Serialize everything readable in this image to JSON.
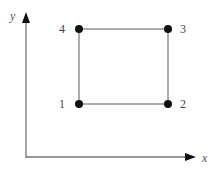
{
  "diagram": {
    "axes": {
      "x_label": "x",
      "y_label": "y",
      "color": "#777777"
    },
    "square": {
      "edge_color": "#777777",
      "vertex_color": "#111111",
      "vertices": [
        {
          "id": "1",
          "label": "1",
          "position": "bottom-left"
        },
        {
          "id": "2",
          "label": "2",
          "position": "bottom-right"
        },
        {
          "id": "3",
          "label": "3",
          "position": "top-right"
        },
        {
          "id": "4",
          "label": "4",
          "position": "top-left"
        }
      ]
    }
  }
}
